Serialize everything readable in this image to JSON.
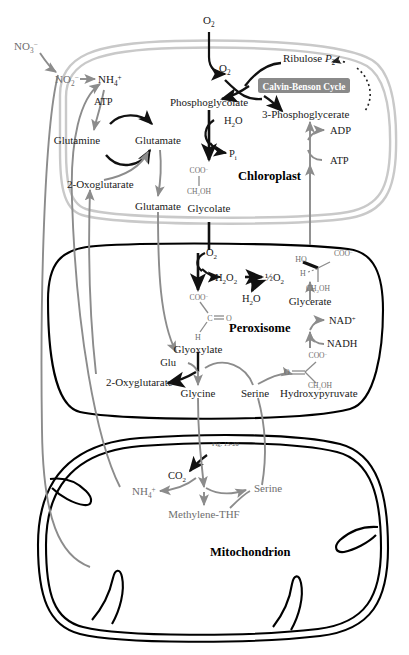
{
  "figure": {
    "fig_reference": "Fig. 15-20"
  },
  "colors": {
    "chloroplast_membrane": "#c9c9c9",
    "peroxisome_membrane": "#000000",
    "mitochondrion_membrane": "#000000",
    "black_arrow": "#111111",
    "gray_arrow": "#8c8c8c",
    "text_dark": "#1a1a1a",
    "text_gray": "#6e6e6e",
    "calvin_box_fill": "#8a8a8a",
    "calvin_box_text": "#ffffff"
  },
  "organelles": [
    {
      "id": "chloroplast",
      "label": "Chloroplast"
    },
    {
      "id": "peroxisome",
      "label": "Peroxisome"
    },
    {
      "id": "mitochondrion",
      "label": "Mitochondrion"
    }
  ],
  "boxed_labels": [
    {
      "id": "calvin-benson-cycle",
      "label": "Calvin-Benson Cycle"
    }
  ],
  "metabolites": {
    "outside": [
      {
        "id": "nitrate-external",
        "base": "NO",
        "sub": "3",
        "sup": "−"
      },
      {
        "id": "oxygen-external",
        "base": "O",
        "sub": "2",
        "sup": ""
      }
    ],
    "chloroplast": [
      {
        "id": "oxygen-chloroplast",
        "base": "O",
        "sub": "2",
        "sup": ""
      },
      {
        "id": "nitrite",
        "base": "NO",
        "sub": "2",
        "sup": "−"
      },
      {
        "id": "ammonium-chloroplast",
        "base": "NH",
        "sub": "4",
        "sup": "+"
      },
      {
        "id": "atp-gs",
        "base": "ATP",
        "sub": "",
        "sup": ""
      },
      {
        "id": "glutamine",
        "base": "Glutamine",
        "sub": "",
        "sup": ""
      },
      {
        "id": "glutamate-upper",
        "base": "Glutamate",
        "sub": "",
        "sup": ""
      },
      {
        "id": "oxoglutarate-chloroplast",
        "base": "2-Oxoglutarate",
        "sub": "",
        "sup": ""
      },
      {
        "id": "glutamate-lower",
        "base": "Glutamate",
        "sub": "",
        "sup": ""
      },
      {
        "id": "phosphoglycolate",
        "base": "Phosphoglycolate",
        "sub": "",
        "sup": ""
      },
      {
        "id": "water-pglycolate",
        "base": "H",
        "sub": "2",
        "sup": "O"
      },
      {
        "id": "phosphate-pi",
        "base": "P",
        "sub": "i",
        "sup": ""
      },
      {
        "id": "glycolate",
        "base": "Glycolate",
        "sub": "",
        "sup": ""
      },
      {
        "id": "ribulose-bisphosphate",
        "base": "Ribulose ",
        "sub": "2",
        "sup": "P"
      },
      {
        "id": "three-phosphoglycerate",
        "base": "3-Phosphoglycerate",
        "sub": "",
        "sup": ""
      },
      {
        "id": "adp",
        "base": "ADP",
        "sub": "",
        "sup": ""
      },
      {
        "id": "atp-glycerate-kinase",
        "base": "ATP",
        "sub": "",
        "sup": ""
      }
    ],
    "peroxisome": [
      {
        "id": "oxygen-peroxisome",
        "base": "O",
        "sub": "2",
        "sup": ""
      },
      {
        "id": "hydrogen-peroxide",
        "base": "H",
        "sub": "2",
        "sup": "O2"
      },
      {
        "id": "half-oxygen",
        "base": "½O",
        "sub": "2",
        "sup": ""
      },
      {
        "id": "water-catalase",
        "base": "H",
        "sub": "2",
        "sup": "O"
      },
      {
        "id": "glyoxylate",
        "base": "Glyoxylate",
        "sub": "",
        "sup": ""
      },
      {
        "id": "glutamate-glu",
        "base": "Glu",
        "sub": "",
        "sup": ""
      },
      {
        "id": "oxyglutarate-peroxisome",
        "base": "2-Oxyglutarate",
        "sub": "",
        "sup": ""
      },
      {
        "id": "glycine",
        "base": "Glycine",
        "sub": "",
        "sup": ""
      },
      {
        "id": "serine-peroxisome",
        "base": "Serine",
        "sub": "",
        "sup": ""
      },
      {
        "id": "hydroxypyruvate",
        "base": "Hydroxypyruvate",
        "sub": "",
        "sup": ""
      },
      {
        "id": "glycerate",
        "base": "Glycerate",
        "sub": "",
        "sup": ""
      },
      {
        "id": "nad-plus",
        "base": "NAD",
        "sub": "",
        "sup": "+"
      },
      {
        "id": "nadh",
        "base": "NADH",
        "sub": "",
        "sup": ""
      }
    ],
    "mitochondrion": [
      {
        "id": "carbon-dioxide",
        "base": "CO",
        "sub": "2",
        "sup": ""
      },
      {
        "id": "ammonium-mitochondrion",
        "base": "NH",
        "sub": "4",
        "sup": "+"
      },
      {
        "id": "serine-mitochondrion",
        "base": "Serine",
        "sub": "",
        "sup": ""
      },
      {
        "id": "methylene-thf",
        "base": "Methylene-THF",
        "sub": "",
        "sup": ""
      }
    ]
  },
  "structures": [
    {
      "id": "glycolate-structure",
      "lines": [
        "COO−",
        "CH2OH"
      ],
      "top": "COO",
      "top_sup": "−",
      "bottom": "CH",
      "bottom_sub": "2",
      "bottom_rest": "OH"
    },
    {
      "id": "glyoxylate-structure",
      "top": "COO",
      "top_sup": "−",
      "middle": "C",
      "middle_rest": "O",
      "bottom": "H"
    },
    {
      "id": "glycerate-structure",
      "left_top": "HO",
      "right_top": "COO",
      "right_top_sup": "−",
      "left_bottom": "H",
      "right_bottom": "CH",
      "right_bottom_sub": "2",
      "right_bottom_rest": "OH"
    },
    {
      "id": "hydroxypyruvate-structure",
      "left": "O",
      "right_top": "COO",
      "right_top_sup": "−",
      "right_bottom": "CH",
      "right_bottom_sub": "2",
      "right_bottom_rest": "OH"
    }
  ],
  "labels": {
    "no3": "NO",
    "no3_sub": "3",
    "no3_sup": "−",
    "no2": "NO",
    "no2_sub": "2",
    "no2_sup": "−",
    "nh4": "NH",
    "nh4_sub": "4",
    "nh4_sup": "+",
    "o2": "O",
    "o2_sub": "2",
    "atp": "ATP",
    "adp": "ADP",
    "glutamine": "Glutamine",
    "glutamate": "Glutamate",
    "oxoglutarate": "2-Oxoglutarate",
    "oxyglutarate": "2-Oxyglutarate",
    "phosphoglycolate": "Phosphoglycolate",
    "h2o": "H",
    "h2o_sub": "2",
    "h2o_rest": "O",
    "pi": "P",
    "pi_sub": "i",
    "glycolate": "Glycolate",
    "ribulose": "Ribulose ",
    "ribulose_p": "P",
    "ribulose_sub": "2",
    "three_pg": "3-Phosphoglycerate",
    "calvin": "Calvin-Benson Cycle",
    "chloroplast": "Chloroplast",
    "h2o2": "H",
    "h2o2_sub2": "2",
    "h2o2_o": "O",
    "h2o2_sub2b": "2",
    "half_o2": "½O",
    "half_o2_sub": "2",
    "glyoxylate": "Glyoxylate",
    "glu": "Glu",
    "glycine": "Glycine",
    "serine": "Serine",
    "hydroxypyruvate": "Hydroxypyruvate",
    "glycerate": "Glycerate",
    "nad": "NAD",
    "nad_sup": "+",
    "nadh": "NADH",
    "peroxisome": "Peroxisome",
    "co2": "CO",
    "co2_sub": "2",
    "methylene_thf": "Methylene-THF",
    "mitochondrion": "Mitochondrion",
    "fig_ref": "Fig. 15-20",
    "coo": "COO",
    "coo_sup": "−",
    "ch2oh": "CH",
    "ch2oh_sub": "2",
    "ch2oh_rest": "OH",
    "c_atom": "C",
    "o_atom": "O",
    "h_atom": "H",
    "ho_atom": "HO"
  }
}
